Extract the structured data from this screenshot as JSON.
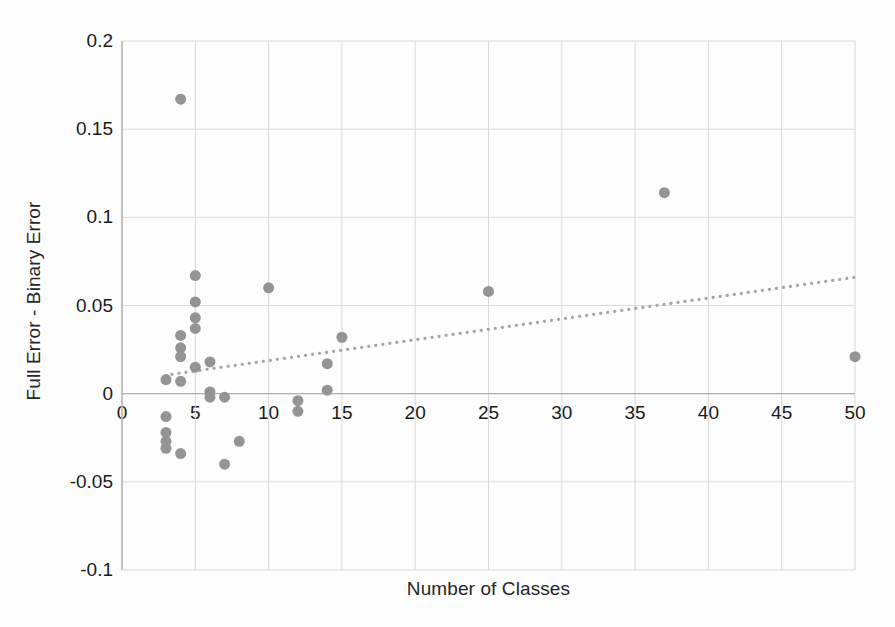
{
  "chart_data": {
    "type": "scatter",
    "title": "",
    "xlabel": "Number of Classes",
    "ylabel": "Full Error - Binary Error",
    "xlim": [
      0,
      50
    ],
    "ylim": [
      -0.1,
      0.2
    ],
    "xticks": [
      0,
      5,
      10,
      15,
      20,
      25,
      30,
      35,
      40,
      45,
      50
    ],
    "xtick_labels": [
      "0",
      "5",
      "10",
      "15",
      "20",
      "25",
      "30",
      "35",
      "40",
      "45",
      "50"
    ],
    "yticks": [
      -0.1,
      -0.05,
      0,
      0.05,
      0.1,
      0.15,
      0.2
    ],
    "ytick_labels": [
      "-0.1",
      "-0.05",
      "0",
      "0.05",
      "0.1",
      "0.15",
      "0.2"
    ],
    "grid": true,
    "grid_color": "#d9d9d9",
    "marker_color": "#949494",
    "marker_size": 11,
    "legend": "none",
    "points": [
      {
        "x": 4,
        "y": 0.167
      },
      {
        "x": 37,
        "y": 0.114
      },
      {
        "x": 5,
        "y": 0.067
      },
      {
        "x": 10,
        "y": 0.06
      },
      {
        "x": 25,
        "y": 0.058
      },
      {
        "x": 5,
        "y": 0.052
      },
      {
        "x": 5,
        "y": 0.043
      },
      {
        "x": 5,
        "y": 0.037
      },
      {
        "x": 4,
        "y": 0.033
      },
      {
        "x": 15,
        "y": 0.032
      },
      {
        "x": 4,
        "y": 0.026
      },
      {
        "x": 4,
        "y": 0.021
      },
      {
        "x": 50,
        "y": 0.021
      },
      {
        "x": 6,
        "y": 0.018
      },
      {
        "x": 14,
        "y": 0.017
      },
      {
        "x": 5,
        "y": 0.015
      },
      {
        "x": 3,
        "y": 0.008
      },
      {
        "x": 4,
        "y": 0.007
      },
      {
        "x": 6,
        "y": 0.001
      },
      {
        "x": 14,
        "y": 0.002
      },
      {
        "x": 6,
        "y": -0.002
      },
      {
        "x": 12,
        "y": -0.004
      },
      {
        "x": 7,
        "y": -0.002
      },
      {
        "x": 12,
        "y": -0.01
      },
      {
        "x": 3,
        "y": -0.013
      },
      {
        "x": 3,
        "y": -0.022
      },
      {
        "x": 3,
        "y": -0.027
      },
      {
        "x": 3,
        "y": -0.031
      },
      {
        "x": 4,
        "y": -0.034
      },
      {
        "x": 8,
        "y": -0.027
      },
      {
        "x": 7,
        "y": -0.04
      }
    ],
    "trendline": {
      "style": "dotted",
      "color": "#a6a6a6",
      "x_start": 3.4,
      "y_start": 0.011,
      "x_end": 50,
      "y_end": 0.066
    }
  }
}
